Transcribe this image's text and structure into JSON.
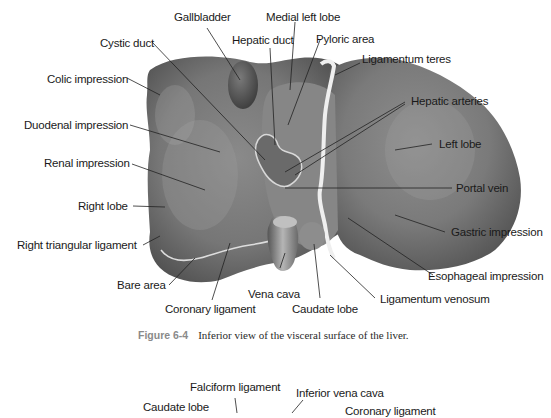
{
  "figure_top": {
    "caption": {
      "number": "Figure 6-4",
      "text": "Inferior view of the visceral surface of the liver."
    },
    "labels": {
      "gallbladder": "Gallbladder",
      "medial_left_lobe": "Medial left lobe",
      "cystic_duct": "Cystic duct",
      "hepatic_duct": "Hepatic duct",
      "pyloric_area": "Pyloric area",
      "ligamentum_teres": "Ligamentum teres",
      "colic_impression": "Colic impression",
      "hepatic_arteries": "Hepatic arteries",
      "duodenal_impression": "Duodenal impression",
      "left_lobe": "Left lobe",
      "renal_impression": "Renal impression",
      "portal_vein": "Portal vein",
      "right_lobe": "Right lobe",
      "gastric_impression": "Gastric impression",
      "right_triangular_ligament": "Right triangular ligament",
      "esophageal_impression": "Esophageal impression",
      "bare_area": "Bare area",
      "vena_cava": "Vena cava",
      "ligamentum_venosum": "Ligamentum venosum",
      "coronary_ligament": "Coronary ligament",
      "caudate_lobe": "Caudate lobe"
    }
  },
  "figure_bottom": {
    "labels": {
      "falciform_ligament": "Falciform ligament",
      "inferior_vena_cava": "Inferior vena cava",
      "caudate_lobe": "Caudate lobe",
      "coronary_ligament_clipped": "Coronary ligament"
    }
  },
  "colors": {
    "organ_base": "#8c8c8c",
    "organ_dark": "#5e5e5e",
    "organ_light": "#c4c4c4",
    "ligament": "#eeeeee",
    "leader_line": "#222222",
    "caption_fig": "#8a8a8a"
  }
}
